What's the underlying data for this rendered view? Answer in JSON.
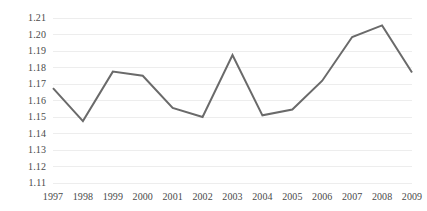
{
  "chart_data": {
    "type": "line",
    "title": "",
    "subtitle": "",
    "xlabel": "",
    "ylabel": "",
    "categories": [
      "1997",
      "1998",
      "1999",
      "2000",
      "2001",
      "2002",
      "2003",
      "2004",
      "2005",
      "2006",
      "2007",
      "2008",
      "2009"
    ],
    "values": [
      1.1675,
      1.1475,
      1.1775,
      1.175,
      1.1555,
      1.15,
      1.1875,
      1.151,
      1.1545,
      1.172,
      1.1985,
      1.2055,
      1.177
    ],
    "series": [
      {
        "name": "",
        "values": [
          1.1675,
          1.1475,
          1.1775,
          1.175,
          1.1555,
          1.15,
          1.1875,
          1.151,
          1.1545,
          1.172,
          1.1985,
          1.2055,
          1.177
        ]
      }
    ],
    "ylim": [
      1.11,
      1.21
    ],
    "y_ticks": [
      "1.21",
      "1.20",
      "1.19",
      "1.18",
      "1.17",
      "1.16",
      "1.15",
      "1.14",
      "1.13",
      "1.12",
      "1.11"
    ],
    "y_tick_values": [
      1.21,
      1.2,
      1.19,
      1.18,
      1.17,
      1.16,
      1.15,
      1.14,
      1.13,
      1.12,
      1.11
    ],
    "grid": true,
    "grid_axis": "y",
    "legend": false,
    "legend_position": "none",
    "annotations": [],
    "colors": {
      "line": "#6a6a6a",
      "grid": "#ededed",
      "tick_label": "#4a4a4a",
      "background": "#ffffff"
    },
    "line_width": 2
  }
}
